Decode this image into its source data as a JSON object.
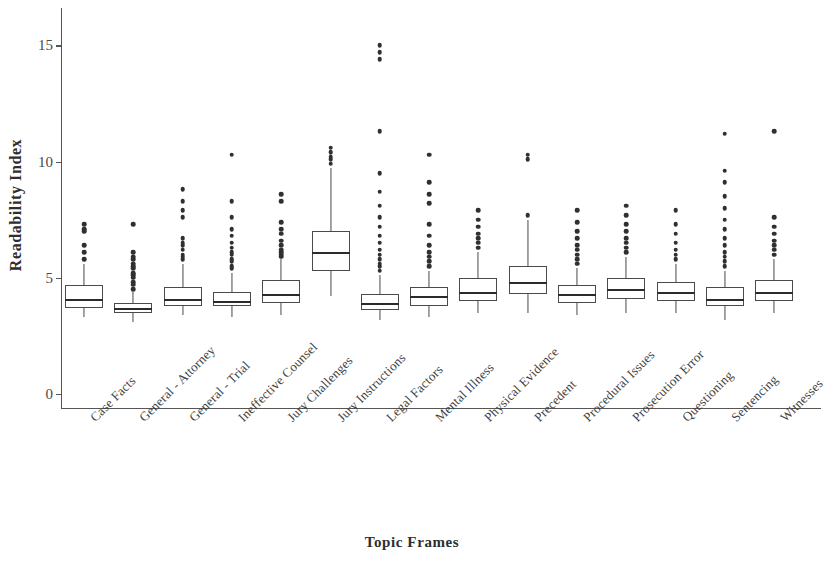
{
  "chart_data": {
    "type": "box",
    "title": "",
    "xlabel": "Topic Frames",
    "ylabel": "Readability Index",
    "ylim": [
      0,
      16.2
    ],
    "yticks": [
      0,
      5,
      10,
      15
    ],
    "ytick_labels": [
      "0",
      "5",
      "10",
      "15"
    ],
    "grid": false,
    "legend": "none",
    "categories": [
      "Case Facts",
      "General - Attorney",
      "General - Trial",
      "Ineffective Counsel",
      "Jury Challenges",
      "Jury Instructions",
      "Legal Factors",
      "Mental Illness",
      "Physical Evidence",
      "Precedent",
      "Procedural Issues",
      "Prosecution Error",
      "Questioning",
      "Sentencing",
      "Witnesses"
    ],
    "boxes": [
      {
        "name": "Case Facts",
        "whisker_low": 3.3,
        "q1": 3.7,
        "median": 4.1,
        "q3": 4.7,
        "whisker_high": 5.6,
        "outliers": [
          5.8,
          6.1,
          6.4,
          7.0,
          7.1,
          7.3
        ]
      },
      {
        "name": "General - Attorney",
        "whisker_low": 3.1,
        "q1": 3.5,
        "median": 3.7,
        "q3": 3.9,
        "whisker_high": 4.4,
        "outliers": [
          4.5,
          4.7,
          4.8,
          5.0,
          5.1,
          5.2,
          5.4,
          5.5,
          5.6,
          5.8,
          5.9,
          6.1,
          7.3
        ]
      },
      {
        "name": "General - Trial",
        "whisker_low": 3.4,
        "q1": 3.8,
        "median": 4.1,
        "q3": 4.6,
        "whisker_high": 5.6,
        "outliers": [
          5.8,
          5.9,
          6.0,
          6.2,
          6.4,
          6.5,
          6.7,
          7.6,
          7.9,
          8.3,
          8.8
        ]
      },
      {
        "name": "Ineffective Counsel",
        "whisker_low": 3.3,
        "q1": 3.8,
        "median": 4.0,
        "q3": 4.4,
        "whisker_high": 5.2,
        "outliers": [
          5.4,
          5.5,
          5.7,
          5.8,
          6.0,
          6.1,
          6.3,
          6.5,
          6.8,
          7.1,
          7.6,
          8.3,
          10.3
        ]
      },
      {
        "name": "Jury Challenges",
        "whisker_low": 3.4,
        "q1": 3.9,
        "median": 4.3,
        "q3": 4.9,
        "whisker_high": 5.8,
        "outliers": [
          5.9,
          6.0,
          6.1,
          6.2,
          6.4,
          6.6,
          6.9,
          7.1,
          7.4,
          8.3,
          8.6
        ]
      },
      {
        "name": "Jury Instructions",
        "whisker_low": 4.2,
        "q1": 5.3,
        "median": 6.1,
        "q3": 7.0,
        "whisker_high": 9.7,
        "outliers": [
          9.9,
          10.1,
          10.2,
          10.4,
          10.6
        ]
      },
      {
        "name": "Legal Factors",
        "whisker_low": 3.2,
        "q1": 3.6,
        "median": 3.9,
        "q3": 4.3,
        "whisker_high": 5.1,
        "outliers": [
          5.3,
          5.5,
          5.6,
          5.8,
          6.0,
          6.2,
          6.5,
          6.8,
          7.2,
          7.6,
          8.1,
          8.7,
          9.5,
          11.3,
          14.4,
          14.7,
          15.0
        ]
      },
      {
        "name": "Mental Illness",
        "whisker_low": 3.3,
        "q1": 3.8,
        "median": 4.2,
        "q3": 4.6,
        "whisker_high": 5.3,
        "outliers": [
          5.5,
          5.7,
          5.9,
          6.1,
          6.4,
          6.8,
          7.3,
          8.2,
          8.6,
          9.1,
          10.3
        ]
      },
      {
        "name": "Physical Evidence",
        "whisker_low": 3.5,
        "q1": 4.0,
        "median": 4.4,
        "q3": 5.0,
        "whisker_high": 6.1,
        "outliers": [
          6.3,
          6.5,
          6.7,
          6.9,
          7.2,
          7.5,
          7.9
        ]
      },
      {
        "name": "Precedent",
        "whisker_low": 3.5,
        "q1": 4.3,
        "median": 4.8,
        "q3": 5.5,
        "whisker_high": 7.5,
        "outliers": [
          7.7,
          10.1,
          10.3
        ]
      },
      {
        "name": "Procedural Issues",
        "whisker_low": 3.4,
        "q1": 3.9,
        "median": 4.3,
        "q3": 4.7,
        "whisker_high": 5.4,
        "outliers": [
          5.6,
          5.8,
          6.0,
          6.2,
          6.4,
          6.7,
          7.0,
          7.4,
          7.9
        ]
      },
      {
        "name": "Prosecution Error",
        "whisker_low": 3.5,
        "q1": 4.1,
        "median": 4.5,
        "q3": 5.0,
        "whisker_high": 5.9,
        "outliers": [
          6.1,
          6.3,
          6.5,
          6.7,
          7.0,
          7.3,
          7.7,
          8.1
        ]
      },
      {
        "name": "Questioning",
        "whisker_low": 3.5,
        "q1": 4.0,
        "median": 4.4,
        "q3": 4.8,
        "whisker_high": 5.6,
        "outliers": [
          5.8,
          6.0,
          6.2,
          6.5,
          6.9,
          7.3,
          7.9
        ]
      },
      {
        "name": "Sentencing",
        "whisker_low": 3.2,
        "q1": 3.8,
        "median": 4.1,
        "q3": 4.6,
        "whisker_high": 5.3,
        "outliers": [
          5.5,
          5.7,
          5.9,
          6.1,
          6.4,
          6.7,
          7.1,
          7.5,
          8.0,
          8.5,
          9.1,
          9.6,
          11.2
        ]
      },
      {
        "name": "Witnesses",
        "whisker_low": 3.5,
        "q1": 4.0,
        "median": 4.4,
        "q3": 4.9,
        "whisker_high": 5.8,
        "outliers": [
          6.0,
          6.2,
          6.4,
          6.6,
          6.9,
          7.2,
          7.6,
          11.3
        ]
      }
    ]
  },
  "colors": {
    "axis": "#555555",
    "box_stroke": "#4a4a4a",
    "median": "#2b2b2b",
    "outlier": "#303030",
    "background": "#ffffff",
    "text": "#3a3a3a"
  }
}
